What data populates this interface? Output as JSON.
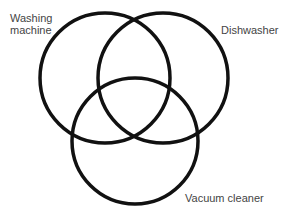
{
  "diagram": {
    "type": "venn",
    "sets": [
      {
        "id": "washing_machine",
        "label_line1": "Washing",
        "label_line2": "machine",
        "cx": 105,
        "cy": 78,
        "r": 65
      },
      {
        "id": "dishwasher",
        "label": "Dishwasher",
        "cx": 163,
        "cy": 78,
        "r": 65
      },
      {
        "id": "vacuum_cleaner",
        "label": "Vacuum cleaner",
        "cx": 135,
        "cy": 141,
        "r": 63
      }
    ],
    "stroke_color": "#111111",
    "stroke_width": 3.5
  }
}
